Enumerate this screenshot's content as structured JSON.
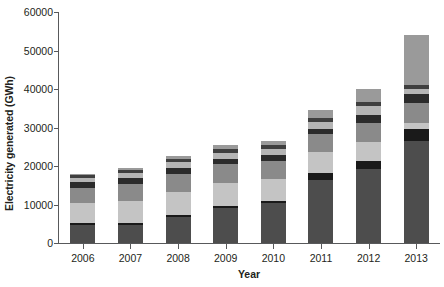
{
  "chart_data": {
    "type": "bar",
    "subtype": "stacked-vertical",
    "title": "",
    "xlabel": "Year",
    "ylabel": "Electricity generated (GWh)",
    "categories": [
      "2006",
      "2007",
      "2008",
      "2009",
      "2010",
      "2011",
      "2012",
      "2013"
    ],
    "ylim": [
      0,
      60000
    ],
    "ytick_values": [
      0,
      10000,
      20000,
      30000,
      40000,
      50000,
      60000
    ],
    "ytick_labels": [
      "0",
      "10000",
      "20000",
      "30000",
      "40000",
      "50000",
      "60000"
    ],
    "grid": false,
    "legend": "none",
    "series": [
      {
        "name": "segment-1",
        "color": "#4d4d4d",
        "values": [
          4700,
          4600,
          6800,
          9000,
          10500,
          16300,
          19300,
          26500
        ]
      },
      {
        "name": "segment-2",
        "color": "#1a1a1a",
        "values": [
          500,
          500,
          500,
          500,
          500,
          2000,
          2000,
          3200
        ]
      },
      {
        "name": "segment-3",
        "color": "#c4c4c4",
        "values": [
          5300,
          5700,
          5900,
          6000,
          5500,
          5300,
          5000,
          1500
        ]
      },
      {
        "name": "segment-4",
        "color": "#8a8a8a",
        "values": [
          3800,
          4600,
          4800,
          4900,
          4800,
          4600,
          5000,
          5300
        ]
      },
      {
        "name": "segment-5",
        "color": "#2b2b2b",
        "values": [
          1500,
          1400,
          1500,
          1500,
          1500,
          1500,
          2000,
          2300
        ]
      },
      {
        "name": "segment-6",
        "color": "#b5b5b5",
        "values": [
          1000,
          1300,
          1500,
          1600,
          1700,
          1800,
          2300,
          1200
        ]
      },
      {
        "name": "segment-7",
        "color": "#3f3f3f",
        "values": [
          900,
          800,
          800,
          900,
          900,
          1000,
          1100,
          1000
        ]
      },
      {
        "name": "segment-8",
        "color": "#9a9a9a",
        "values": [
          300,
          600,
          700,
          1100,
          1100,
          2000,
          3300,
          13000
        ]
      }
    ],
    "totals": [
      18000,
      19500,
      22500,
      25500,
      26500,
      34500,
      40000,
      54000
    ]
  },
  "axis": {
    "y_title": "Electricity generated (GWh)",
    "x_title": "Year"
  }
}
